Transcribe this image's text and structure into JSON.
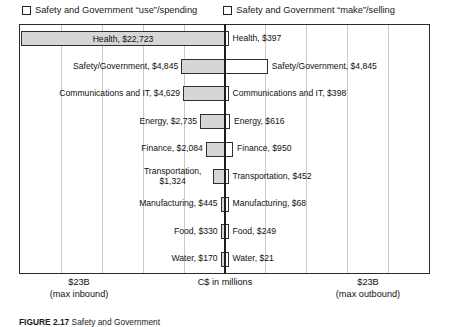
{
  "legend": {
    "left": {
      "label": "Safety and Government “use”/spending",
      "marker": "checkbox-empty"
    },
    "right": {
      "label": "Safety and Government “make”/selling",
      "marker": "checkbox-empty"
    }
  },
  "axis": {
    "left_max": "$23B",
    "left_max_sub": "(max inbound)",
    "center": "C$ in millions",
    "right_max": "$23B",
    "right_max_sub": "(max outbound)"
  },
  "caption": {
    "figure_number": "FIGURE 2.17",
    "text": "Safety and Government"
  },
  "chart_data": {
    "type": "bar",
    "title": "",
    "subtitle": "",
    "orientation": "horizontal-diverging",
    "xlabel": "C$ in millions",
    "ylabel": "",
    "xlim": [
      -23000,
      23000
    ],
    "grid": true,
    "gridline_count": 10,
    "legend_position": "top",
    "categories": [
      "Health",
      "Safety/Government",
      "Communications and IT",
      "Energy",
      "Finance",
      "Transportation",
      "Manufacturing",
      "Food",
      "Water"
    ],
    "series": [
      {
        "name": "Safety and Government “use”/spending",
        "side": "left",
        "fill": "#d6d6d6",
        "values": [
          22723,
          4845,
          4629,
          2735,
          2084,
          1324,
          445,
          330,
          170
        ]
      },
      {
        "name": "Safety and Government “make”/selling",
        "side": "right",
        "fill": "#ffffff",
        "values": [
          397,
          4845,
          398,
          616,
          950,
          452,
          68,
          249,
          21
        ]
      }
    ]
  },
  "rows": [
    {
      "category": "Health",
      "left": {
        "label": "Health, $22,723",
        "value": 22723,
        "label_inside": true
      },
      "right": {
        "label": "Health, $397",
        "value": 397,
        "label_inside": false
      }
    },
    {
      "category": "Safety/Government",
      "left": {
        "label": "Safety/Government, $4,845",
        "value": 4845,
        "label_inside": false
      },
      "right": {
        "label": "Safety/Government,  $4,845",
        "value": 4845,
        "label_inside": false
      }
    },
    {
      "category": "Communications and IT",
      "left": {
        "label": "Communications and IT, $4,629",
        "value": 4629,
        "label_inside": false
      },
      "right": {
        "label": "Communications and IT,  $398",
        "value": 398,
        "label_inside": false
      }
    },
    {
      "category": "Energy",
      "left": {
        "label": "Energy, $2,735",
        "value": 2735,
        "label_inside": false
      },
      "right": {
        "label": "Energy,  $616",
        "value": 616,
        "label_inside": false
      }
    },
    {
      "category": "Finance",
      "left": {
        "label": "Finance, $2,084",
        "value": 2084,
        "label_inside": false
      },
      "right": {
        "label": "Finance, $950",
        "value": 950,
        "label_inside": false
      }
    },
    {
      "category": "Transportation",
      "left": {
        "label": "Transportation, $1,324",
        "value": 1324,
        "label_inside": false,
        "wrap": true
      },
      "right": {
        "label": "Transportation, $452",
        "value": 452,
        "label_inside": false
      }
    },
    {
      "category": "Manufacturing",
      "left": {
        "label": "Manufacturing, $445",
        "value": 445,
        "label_inside": false
      },
      "right": {
        "label": "Manufacturing, $68",
        "value": 68,
        "label_inside": false
      }
    },
    {
      "category": "Food",
      "left": {
        "label": "Food, $330",
        "value": 330,
        "label_inside": false
      },
      "right": {
        "label": "Food, $249",
        "value": 249,
        "label_inside": false
      }
    },
    {
      "category": "Water",
      "left": {
        "label": "Water, $170",
        "value": 170,
        "label_inside": false
      },
      "right": {
        "label": "Water, $21",
        "value": 21,
        "label_inside": false
      }
    }
  ]
}
